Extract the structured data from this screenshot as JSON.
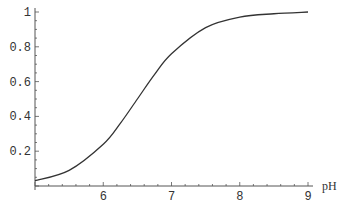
{
  "chart_data": {
    "type": "line",
    "title": "",
    "xlabel": "pH",
    "ylabel": "",
    "xlim": [
      5,
      9
    ],
    "ylim": [
      0,
      1
    ],
    "grid": false,
    "legend": null,
    "x_ticks": [
      "6",
      "7",
      "8",
      "9"
    ],
    "y_ticks": [
      "0.2",
      "0.4",
      "0.6",
      "0.8",
      "1"
    ],
    "series": [
      {
        "name": "fraction",
        "x": [
          5.0,
          5.5,
          6.0,
          6.25,
          6.5,
          6.75,
          7.0,
          7.5,
          8.0,
          8.5,
          9.0
        ],
        "values": [
          0.03,
          0.09,
          0.24,
          0.36,
          0.5,
          0.64,
          0.76,
          0.91,
          0.97,
          0.99,
          1.0
        ]
      }
    ],
    "colors": {
      "line": "#333333",
      "axis": "#555555"
    }
  }
}
